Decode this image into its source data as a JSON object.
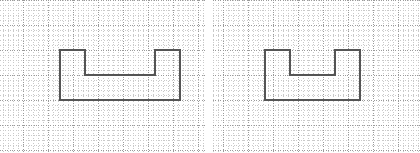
{
  "figure": {
    "background_color": "#ffffff",
    "width": 420,
    "height": 153
  },
  "grid": {
    "major_color": "#9a9a9a",
    "minor_color": "#c9c9c9",
    "major_spacing": 25,
    "minor_spacing": 5,
    "style": "dotted",
    "description": "dotted graph paper"
  },
  "shape_style": {
    "stroke_color": "#555555",
    "stroke_width": 2,
    "fill": "none"
  },
  "panels": [
    {
      "id": "left",
      "name": "left-shape",
      "label": "",
      "origin_x": 0,
      "origin_y": 0,
      "grid_offset_x": 23,
      "grid_offset_y": 25,
      "shape": {
        "type": "polygon",
        "description": "crenellated castle outline with two raised towers and a central notch",
        "points": [
          [
            60,
            100
          ],
          [
            60,
            50
          ],
          [
            85,
            50
          ],
          [
            85,
            75
          ],
          [
            155,
            75
          ],
          [
            155,
            50
          ],
          [
            180,
            50
          ],
          [
            180,
            100
          ]
        ],
        "closed": true,
        "width_units": 120,
        "height_units": 50
      }
    },
    {
      "id": "right",
      "name": "right-shape",
      "label": "",
      "origin_x": 213,
      "origin_y": 0,
      "grid_offset_x": 10,
      "grid_offset_y": 25,
      "shape": {
        "type": "polygon",
        "description": "crenellated castle outline, narrower, with two raised towers and a central notch",
        "points": [
          [
            52,
            100
          ],
          [
            52,
            50
          ],
          [
            77,
            50
          ],
          [
            77,
            75
          ],
          [
            122,
            75
          ],
          [
            122,
            50
          ],
          [
            147,
            50
          ],
          [
            147,
            100
          ]
        ],
        "closed": true,
        "width_units": 95,
        "height_units": 50
      }
    }
  ]
}
